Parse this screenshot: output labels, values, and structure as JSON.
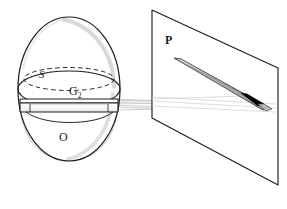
{
  "figure": {
    "kind": "optical-projection-diagram",
    "width": 287,
    "height": 209,
    "background_color": "#ffffff",
    "ink_color": "#1c1c1c"
  },
  "labels": {
    "sphere_body": "O",
    "sphere_surface": "S",
    "internal_disk": "G",
    "internal_disk_subscript": "2",
    "projection_plane": "P"
  },
  "elements": {
    "sphere": {
      "name": "sphere-outline",
      "center_x": 69,
      "center_y": 89,
      "radius_x": 51,
      "radius_y": 72,
      "stroke": "#1c1c1c"
    },
    "equator_ellipse": {
      "name": "equator-ellipse",
      "center_x": 69,
      "center_y": 89,
      "radius_x": 51,
      "radius_y": 18,
      "stroke": "#1c1c1c"
    },
    "dashed_ellipse": {
      "name": "hidden-circle-dashed",
      "center_x": 69,
      "center_y": 80,
      "radius_x": 45,
      "radius_y": 12,
      "stroke": "#1c1c1c",
      "dash": "4 3"
    },
    "internal_disk": {
      "name": "internal-disk-slab",
      "left_x": 20,
      "right_x": 118,
      "top_y": 99,
      "bottom_y": 112,
      "fill": "#fbfbfb",
      "stroke": "#1c1c1c"
    },
    "plane": {
      "name": "projection-plane-P",
      "corners": [
        [
          152,
          10
        ],
        [
          278,
          68
        ],
        [
          278,
          185
        ],
        [
          152,
          118
        ]
      ],
      "fill": "#ffffff",
      "stroke": "#1c1c1c"
    },
    "projected_band": {
      "name": "projected-light-band",
      "start_x": 176,
      "start_y": 61,
      "end_x": 268,
      "end_y": 109,
      "thickness": 7,
      "fill_light": "#d4d4d4",
      "fill_mid": "#a8a8a8"
    },
    "dark_segment": {
      "name": "dark-band-segment",
      "start_x": 243,
      "start_y": 96,
      "end_x": 262,
      "end_y": 106,
      "fill": "#000000"
    },
    "ray_bundle": {
      "name": "light-ray-bundle",
      "origin_x": 118,
      "count": 6,
      "stroke": "#b0b0b0",
      "rays": [
        {
          "y0": 99,
          "x1": 268,
          "y1": 103
        },
        {
          "y0": 101,
          "x1": 268,
          "y1": 106
        },
        {
          "y0": 103,
          "x1": 268,
          "y1": 109
        },
        {
          "y0": 106,
          "x1": 176,
          "y1": 62
        },
        {
          "y0": 108,
          "x1": 230,
          "y1": 92
        },
        {
          "y0": 111,
          "x1": 262,
          "y1": 106
        }
      ]
    },
    "shading": {
      "name": "sphere-shading-arc",
      "stroke": "#cccccc"
    }
  }
}
